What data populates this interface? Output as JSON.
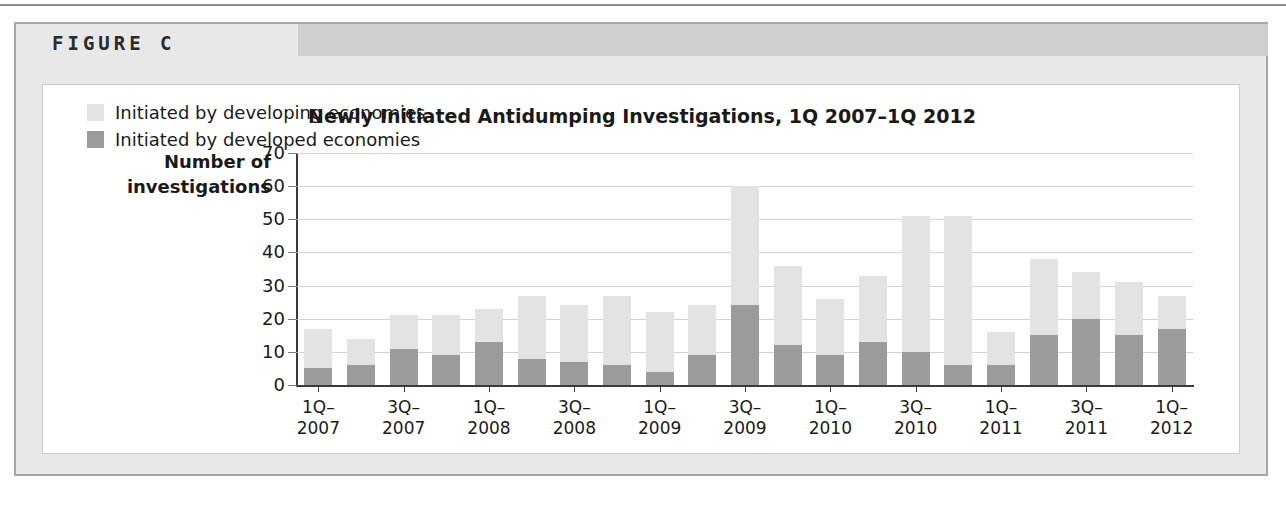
{
  "page": {
    "figure_label": "FIGURE C"
  },
  "colors": {
    "developing": "#e3e3e3",
    "developed": "#9b9b9b",
    "grid": "#d4d4d4",
    "axis": "#3a3a3a",
    "panel_bg": "#e8e8e8",
    "header_band": "#cfcfcf",
    "card_bg": "#ffffff",
    "text": "#1a1a1a"
  },
  "chart_data": {
    "type": "bar",
    "title": "Newly Initiated Antidumping Investigations, 1Q 2007–1Q 2012",
    "xlabel": "",
    "ylabel": "Number of investigations",
    "ylabel_lines": [
      "Number of",
      "investigations"
    ],
    "ylim": [
      0,
      70
    ],
    "yticks": [
      0,
      10,
      20,
      30,
      40,
      50,
      60,
      70
    ],
    "ytick_labels": [
      "0",
      "10",
      "20",
      "30",
      "40",
      "50",
      "60",
      "70"
    ],
    "grid": true,
    "stacked": true,
    "legend_position": "upper-left-inside",
    "x": [
      "1Q-2007",
      "2Q-2007",
      "3Q-2007",
      "4Q-2007",
      "1Q-2008",
      "2Q-2008",
      "3Q-2008",
      "4Q-2008",
      "1Q-2009",
      "2Q-2009",
      "3Q-2009",
      "4Q-2009",
      "1Q-2010",
      "2Q-2010",
      "3Q-2010",
      "4Q-2010",
      "1Q-2011",
      "2Q-2011",
      "3Q-2011",
      "4Q-2011",
      "1Q-2012"
    ],
    "xtick_labels": [
      {
        "index": 0,
        "lines": [
          "1Q–",
          "2007"
        ]
      },
      {
        "index": 2,
        "lines": [
          "3Q–",
          "2007"
        ]
      },
      {
        "index": 4,
        "lines": [
          "1Q–",
          "2008"
        ]
      },
      {
        "index": 6,
        "lines": [
          "3Q–",
          "2008"
        ]
      },
      {
        "index": 8,
        "lines": [
          "1Q–",
          "2009"
        ]
      },
      {
        "index": 10,
        "lines": [
          "3Q–",
          "2009"
        ]
      },
      {
        "index": 12,
        "lines": [
          "1Q–",
          "2010"
        ]
      },
      {
        "index": 14,
        "lines": [
          "3Q–",
          "2010"
        ]
      },
      {
        "index": 16,
        "lines": [
          "1Q–",
          "2011"
        ]
      },
      {
        "index": 18,
        "lines": [
          "3Q–",
          "2011"
        ]
      },
      {
        "index": 20,
        "lines": [
          "1Q–",
          "2012"
        ]
      }
    ],
    "series": [
      {
        "name": "Initiated by developed economies",
        "key": "developed",
        "color": "#9b9b9b",
        "values": [
          5,
          6,
          11,
          9,
          13,
          8,
          7,
          6,
          4,
          9,
          24,
          12,
          9,
          13,
          10,
          6,
          6,
          15,
          20,
          15,
          17
        ]
      },
      {
        "name": "Initiated by developing economies",
        "key": "developing",
        "color": "#e3e3e3",
        "values": [
          12,
          8,
          10,
          12,
          10,
          19,
          17,
          21,
          18,
          15,
          36,
          24,
          17,
          20,
          41,
          45,
          10,
          23,
          14,
          16,
          10
        ]
      }
    ],
    "totals": [
      17,
      14,
      21,
      21,
      23,
      27,
      24,
      27,
      22,
      24,
      60,
      36,
      26,
      33,
      51,
      51,
      16,
      38,
      34,
      31,
      27
    ],
    "legend": [
      {
        "label": "Initiated by developing economies",
        "color": "#e3e3e3"
      },
      {
        "label": "Initiated by developed economies",
        "color": "#9b9b9b"
      }
    ]
  }
}
